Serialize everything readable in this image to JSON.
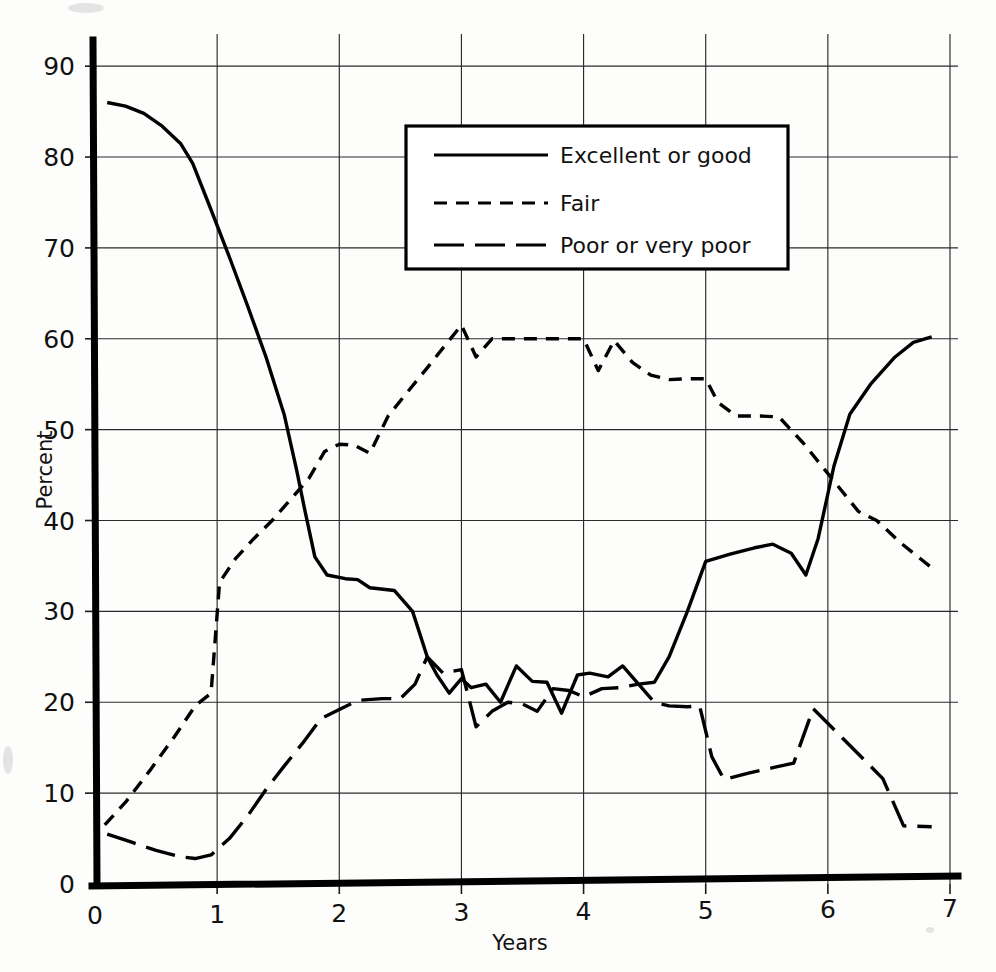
{
  "chart_data": {
    "type": "line",
    "title": "",
    "xlabel": "Years",
    "ylabel": "Percent",
    "xlim": [
      0,
      7
    ],
    "ylim": [
      0,
      92
    ],
    "xticks": [
      "0",
      "1",
      "2",
      "3",
      "4",
      "5",
      "6",
      "7"
    ],
    "yticks": [
      "0",
      "10",
      "20",
      "30",
      "40",
      "50",
      "60",
      "70",
      "80",
      "90"
    ],
    "grid": true,
    "legend_position": "upper-center",
    "series": [
      {
        "name": "Excellent or good",
        "style": "solid",
        "points": [
          [
            0.1,
            86.0
          ],
          [
            0.25,
            85.6
          ],
          [
            0.4,
            84.8
          ],
          [
            0.55,
            83.4
          ],
          [
            0.7,
            81.5
          ],
          [
            0.8,
            79.3
          ],
          [
            0.95,
            74.2
          ],
          [
            1.1,
            69.0
          ],
          [
            1.25,
            63.6
          ],
          [
            1.4,
            58.0
          ],
          [
            1.55,
            51.6
          ],
          [
            1.65,
            45.6
          ],
          [
            1.72,
            41.0
          ],
          [
            1.8,
            36.0
          ],
          [
            1.9,
            34.0
          ],
          [
            2.05,
            33.6
          ],
          [
            2.15,
            33.5
          ],
          [
            2.25,
            32.6
          ],
          [
            2.45,
            32.3
          ],
          [
            2.6,
            30.0
          ],
          [
            2.72,
            25.0
          ],
          [
            2.8,
            23.0
          ],
          [
            2.9,
            21.0
          ],
          [
            3.0,
            22.6
          ],
          [
            3.08,
            21.6
          ],
          [
            3.2,
            22.0
          ],
          [
            3.32,
            20.0
          ],
          [
            3.45,
            24.0
          ],
          [
            3.58,
            22.3
          ],
          [
            3.7,
            22.2
          ],
          [
            3.82,
            18.8
          ],
          [
            3.95,
            23.0
          ],
          [
            4.05,
            23.2
          ],
          [
            4.2,
            22.8
          ],
          [
            4.32,
            24.0
          ],
          [
            4.45,
            22.0
          ],
          [
            4.58,
            22.2
          ],
          [
            4.7,
            25.0
          ],
          [
            4.85,
            30.0
          ],
          [
            5.0,
            35.5
          ],
          [
            5.2,
            36.3
          ],
          [
            5.4,
            37.0
          ],
          [
            5.55,
            37.4
          ],
          [
            5.7,
            36.4
          ],
          [
            5.82,
            34.0
          ],
          [
            5.92,
            38.0
          ],
          [
            6.05,
            46.0
          ],
          [
            6.18,
            51.7
          ],
          [
            6.35,
            55.0
          ],
          [
            6.55,
            58.0
          ],
          [
            6.7,
            59.6
          ],
          [
            6.85,
            60.2
          ]
        ]
      },
      {
        "name": "Fair",
        "style": "dashed-short",
        "points": [
          [
            0.08,
            6.5
          ],
          [
            0.25,
            9.0
          ],
          [
            0.45,
            12.5
          ],
          [
            0.65,
            16.2
          ],
          [
            0.82,
            19.6
          ],
          [
            0.95,
            21.0
          ],
          [
            1.02,
            33.2
          ],
          [
            1.15,
            35.8
          ],
          [
            1.3,
            38.0
          ],
          [
            1.45,
            40.0
          ],
          [
            1.6,
            42.3
          ],
          [
            1.75,
            44.6
          ],
          [
            1.88,
            47.6
          ],
          [
            2.0,
            48.4
          ],
          [
            2.12,
            48.3
          ],
          [
            2.25,
            47.4
          ],
          [
            2.4,
            51.5
          ],
          [
            2.55,
            54.0
          ],
          [
            2.72,
            56.8
          ],
          [
            2.85,
            59.0
          ],
          [
            3.0,
            61.5
          ],
          [
            3.12,
            58.0
          ],
          [
            3.25,
            60.0
          ],
          [
            3.45,
            60.0
          ],
          [
            3.7,
            60.0
          ],
          [
            3.9,
            60.0
          ],
          [
            4.0,
            60.0
          ],
          [
            4.12,
            56.5
          ],
          [
            4.25,
            59.8
          ],
          [
            4.4,
            57.4
          ],
          [
            4.55,
            56.0
          ],
          [
            4.7,
            55.5
          ],
          [
            4.85,
            55.6
          ],
          [
            5.0,
            55.6
          ],
          [
            5.1,
            53.0
          ],
          [
            5.25,
            51.5
          ],
          [
            5.45,
            51.5
          ],
          [
            5.6,
            51.4
          ],
          [
            5.8,
            48.5
          ],
          [
            5.95,
            46.0
          ],
          [
            6.1,
            43.5
          ],
          [
            6.25,
            41.0
          ],
          [
            6.4,
            40.0
          ],
          [
            6.6,
            37.5
          ],
          [
            6.85,
            34.8
          ]
        ]
      },
      {
        "name": "Poor or very poor",
        "style": "dashed-long",
        "points": [
          [
            0.1,
            5.5
          ],
          [
            0.3,
            4.6
          ],
          [
            0.5,
            3.7
          ],
          [
            0.7,
            3.0
          ],
          [
            0.82,
            2.8
          ],
          [
            0.95,
            3.2
          ],
          [
            1.1,
            5.0
          ],
          [
            1.25,
            7.5
          ],
          [
            1.4,
            10.4
          ],
          [
            1.55,
            13.0
          ],
          [
            1.7,
            15.5
          ],
          [
            1.85,
            18.2
          ],
          [
            2.0,
            19.2
          ],
          [
            2.15,
            20.2
          ],
          [
            2.35,
            20.4
          ],
          [
            2.5,
            20.4
          ],
          [
            2.62,
            22.0
          ],
          [
            2.72,
            25.0
          ],
          [
            2.85,
            23.2
          ],
          [
            3.0,
            23.6
          ],
          [
            3.12,
            17.3
          ],
          [
            3.25,
            19.0
          ],
          [
            3.38,
            20.0
          ],
          [
            3.5,
            19.8
          ],
          [
            3.62,
            19.0
          ],
          [
            3.75,
            21.5
          ],
          [
            3.88,
            21.3
          ],
          [
            4.0,
            20.6
          ],
          [
            4.15,
            21.5
          ],
          [
            4.3,
            21.6
          ],
          [
            4.45,
            22.0
          ],
          [
            4.58,
            20.0
          ],
          [
            4.7,
            19.6
          ],
          [
            4.85,
            19.5
          ],
          [
            4.95,
            19.6
          ],
          [
            5.05,
            14.0
          ],
          [
            5.15,
            11.5
          ],
          [
            5.35,
            12.2
          ],
          [
            5.55,
            12.8
          ],
          [
            5.72,
            13.3
          ],
          [
            5.88,
            19.3
          ],
          [
            6.05,
            17.0
          ],
          [
            6.25,
            14.3
          ],
          [
            6.45,
            11.6
          ],
          [
            6.62,
            6.4
          ],
          [
            6.85,
            6.3
          ]
        ]
      }
    ]
  },
  "legend": {
    "items": [
      {
        "label": "Excellent or good",
        "style": "solid"
      },
      {
        "label": "Fair",
        "style": "dashed-short"
      },
      {
        "label": "Poor or very poor",
        "style": "dashed-long"
      }
    ]
  },
  "axes": {
    "y_axis_title": "Percent",
    "x_axis_title": "Years"
  }
}
